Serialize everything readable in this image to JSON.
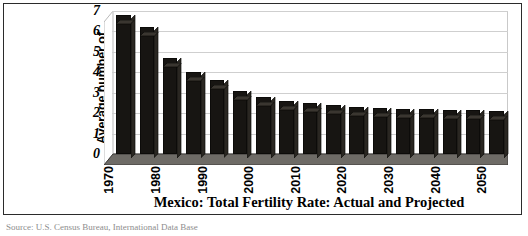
{
  "chart_data": {
    "type": "bar",
    "title": "Mexico: Total Fertility Rate: Actual and Projected",
    "xlabel": "",
    "ylabel": "Average number of children born to a woman",
    "ylabel_lines": [
      "Average number of",
      "children born to a",
      "woman"
    ],
    "ylim": [
      0,
      7
    ],
    "yticks": [
      7,
      6,
      5,
      4,
      3,
      2,
      1,
      0
    ],
    "grid": true,
    "legend": "none",
    "bar_color": "#171512",
    "categories": [
      "1970",
      "1975",
      "1980",
      "1985",
      "1990",
      "1995",
      "2000",
      "2005",
      "2010",
      "2015",
      "2020",
      "2025",
      "2030",
      "2035",
      "2040",
      "2045",
      "2050"
    ],
    "tick_labels": [
      "1970",
      "1980",
      "1990",
      "2000",
      "2010",
      "2020",
      "2030",
      "2040",
      "2050"
    ],
    "values": [
      6.8,
      6.2,
      4.7,
      4.0,
      3.6,
      3.1,
      2.8,
      2.6,
      2.5,
      2.4,
      2.3,
      2.25,
      2.2,
      2.2,
      2.15,
      2.15,
      2.1
    ]
  },
  "source_note": "Source: U.S. Census Bureau, International Data Base"
}
